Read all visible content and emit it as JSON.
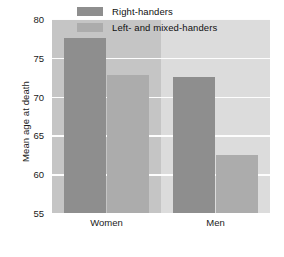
{
  "chart_data": {
    "type": "bar",
    "title": "",
    "xlabel": "",
    "ylabel": "Mean age at death",
    "categories": [
      "Women",
      "Men"
    ],
    "series": [
      {
        "name": "Right-handers",
        "values": [
          77.5,
          72.5
        ],
        "color": "#8e8e8e"
      },
      {
        "name": "Left- and mixed-handers",
        "values": [
          72.8,
          62.5
        ],
        "color": "#acacac"
      }
    ],
    "ylim": [
      55,
      80
    ],
    "yticks": [
      55,
      60,
      65,
      70,
      75,
      80
    ],
    "ytick_labels": [
      "55",
      "60",
      "65",
      "70",
      "75",
      "80"
    ],
    "grid": true,
    "legend_position": "top-center",
    "plot_background": "#d2d2d2"
  }
}
